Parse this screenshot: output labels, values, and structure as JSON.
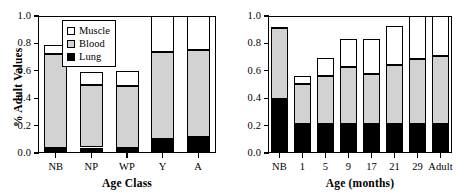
{
  "chart_data": [
    {
      "type": "bar",
      "panel": "left",
      "stacked": true,
      "title": "",
      "xlabel": "Age Class",
      "ylabel": "% Adult Values",
      "categories": [
        "NB",
        "NP",
        "WP",
        "Y",
        "A"
      ],
      "ylim": [
        0.0,
        1.0
      ],
      "yticks": [
        "0.0",
        "0.2",
        "0.4",
        "0.6",
        "0.8",
        "1.0"
      ],
      "ytick_values": [
        0.0,
        0.2,
        0.4,
        0.6,
        0.8,
        1.0
      ],
      "grid": false,
      "legend": "inside upper right",
      "series": [
        {
          "name": "Lung",
          "color": "#000000",
          "values": [
            0.04,
            0.04,
            0.04,
            0.105,
            0.115
          ]
        },
        {
          "name": "Blood",
          "color": "#d2d2d2",
          "values": [
            0.685,
            0.455,
            0.45,
            0.63,
            0.64
          ]
        },
        {
          "name": "Muscle",
          "color": "#ffffff",
          "values": [
            0.065,
            0.095,
            0.11,
            0.265,
            0.245
          ]
        }
      ],
      "cumulative_tops": {
        "lung": [
          0.04,
          0.04,
          0.04,
          0.105,
          0.115
        ],
        "blood": [
          0.725,
          0.495,
          0.49,
          0.735,
          0.755
        ],
        "muscle": [
          0.79,
          0.59,
          0.6,
          1.0,
          1.0
        ]
      }
    },
    {
      "type": "bar",
      "panel": "right",
      "stacked": true,
      "title": "",
      "xlabel": "Age (months)",
      "ylabel": "",
      "categories": [
        "NB",
        "1",
        "5",
        "9",
        "17",
        "21",
        "29",
        "Adult"
      ],
      "ylim": [
        0.0,
        1.0
      ],
      "yticks": [
        "0.0",
        "0.2",
        "0.4",
        "0.6",
        "0.8",
        "1.0"
      ],
      "ytick_values": [
        0.0,
        0.2,
        0.4,
        0.6,
        0.8,
        1.0
      ],
      "grid": false,
      "legend": "none",
      "series": [
        {
          "name": "Lung",
          "color": "#000000",
          "values": [
            0.395,
            0.21,
            0.21,
            0.21,
            0.21,
            0.21,
            0.21,
            0.21
          ]
        },
        {
          "name": "Blood",
          "color": "#d2d2d2",
          "values": [
            0.515,
            0.295,
            0.35,
            0.415,
            0.37,
            0.43,
            0.475,
            0.5
          ]
        },
        {
          "name": "Muscle",
          "color": "#ffffff",
          "values": [
            0.01,
            0.055,
            0.135,
            0.21,
            0.25,
            0.285,
            0.315,
            0.29
          ]
        }
      ],
      "cumulative_tops": {
        "lung": [
          0.395,
          0.21,
          0.21,
          0.21,
          0.21,
          0.21,
          0.21,
          0.21
        ],
        "blood": [
          0.91,
          0.505,
          0.56,
          0.625,
          0.58,
          0.64,
          0.685,
          0.71
        ],
        "muscle": [
          0.92,
          0.56,
          0.695,
          0.835,
          0.83,
          0.925,
          1.0,
          1.0
        ]
      }
    }
  ],
  "legend": {
    "items": [
      {
        "label": "Muscle",
        "color": "#ffffff"
      },
      {
        "label": "Blood",
        "color": "#d2d2d2"
      },
      {
        "label": "Lung",
        "color": "#000000"
      }
    ]
  }
}
